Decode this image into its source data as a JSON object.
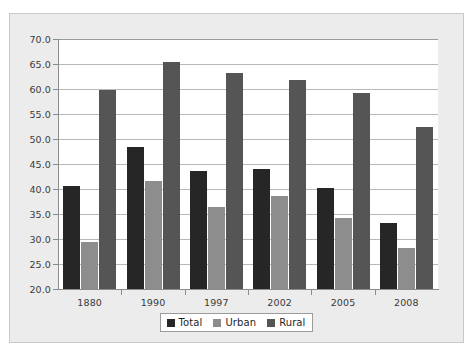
{
  "chart_data": {
    "type": "bar",
    "title": "",
    "subtitle": "",
    "xlabel": "",
    "ylabel": "",
    "categories": [
      "1880",
      "1990",
      "1997",
      "2002",
      "2005",
      "2008"
    ],
    "series": [
      {
        "name": "Total",
        "color": "#262626",
        "values": [
          40.7,
          48.5,
          43.6,
          44.0,
          40.2,
          33.3
        ]
      },
      {
        "name": "Urban",
        "color": "#8d8d8d",
        "values": [
          29.5,
          41.6,
          36.5,
          38.6,
          34.3,
          28.2
        ]
      },
      {
        "name": "Rural",
        "color": "#555555",
        "values": [
          59.8,
          65.5,
          63.2,
          61.9,
          59.2,
          52.5
        ]
      }
    ],
    "ylim": [
      20.0,
      70.0
    ],
    "ytick_step": 5.0,
    "ytick_labels": [
      "20.0",
      "25.0",
      "30.0",
      "35.0",
      "40.0",
      "45.0",
      "50.0",
      "55.0",
      "60.0",
      "65.0",
      "70.0"
    ],
    "grid": true,
    "grid_axis": "y",
    "legend_position": "bottom-center",
    "legend_entries": [
      "Total",
      "Urban",
      "Rural"
    ]
  },
  "colors": {
    "frame_background": "#ececec",
    "frame_border": "#c9c9c9",
    "plot_background": "#ffffff",
    "gridline": "#b8b8b8",
    "axis": "#8c8c8c",
    "tick_text": "#3a3a3a",
    "legend_border": "#9b9b9b",
    "legend_background": "#ffffff"
  }
}
